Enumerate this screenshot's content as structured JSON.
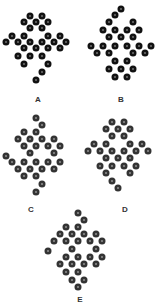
{
  "figure": {
    "panels": [
      {
        "label": "A",
        "label_pos": [
          38,
          96
        ],
        "tone": "dark",
        "dots": [
          [
            30,
            16
          ],
          [
            42,
            16
          ],
          [
            24,
            22
          ],
          [
            36,
            22
          ],
          [
            48,
            22
          ],
          [
            30,
            28
          ],
          [
            42,
            28
          ],
          [
            12,
            36
          ],
          [
            24,
            36
          ],
          [
            48,
            36
          ],
          [
            60,
            36
          ],
          [
            6,
            42
          ],
          [
            18,
            42
          ],
          [
            30,
            42
          ],
          [
            42,
            42
          ],
          [
            54,
            42
          ],
          [
            66,
            42
          ],
          [
            24,
            48
          ],
          [
            36,
            48
          ],
          [
            48,
            48
          ],
          [
            60,
            48
          ],
          [
            18,
            56
          ],
          [
            30,
            56
          ],
          [
            42,
            56
          ],
          [
            24,
            64
          ],
          [
            48,
            64
          ],
          [
            42,
            72
          ],
          [
            36,
            80
          ]
        ]
      },
      {
        "label": "B",
        "label_pos": [
          121,
          96
        ],
        "tone": "dark",
        "dots": [
          [
            121,
            9
          ],
          [
            115,
            15
          ],
          [
            109,
            22
          ],
          [
            133,
            22
          ],
          [
            103,
            30
          ],
          [
            115,
            30
          ],
          [
            127,
            30
          ],
          [
            139,
            30
          ],
          [
            109,
            37
          ],
          [
            121,
            37
          ],
          [
            133,
            37
          ],
          [
            91,
            46
          ],
          [
            103,
            46
          ],
          [
            115,
            46
          ],
          [
            127,
            46
          ],
          [
            139,
            46
          ],
          [
            151,
            46
          ],
          [
            97,
            53
          ],
          [
            109,
            53
          ],
          [
            133,
            53
          ],
          [
            145,
            53
          ],
          [
            115,
            61
          ],
          [
            127,
            61
          ],
          [
            109,
            69
          ],
          [
            121,
            69
          ],
          [
            133,
            69
          ],
          [
            115,
            77
          ],
          [
            127,
            77
          ]
        ]
      },
      {
        "label": "C",
        "label_pos": [
          31,
          206
        ],
        "tone": "gray",
        "dots": [
          [
            36,
            118
          ],
          [
            42,
            125
          ],
          [
            24,
            132
          ],
          [
            36,
            132
          ],
          [
            18,
            139
          ],
          [
            30,
            139
          ],
          [
            42,
            139
          ],
          [
            54,
            139
          ],
          [
            24,
            146
          ],
          [
            36,
            146
          ],
          [
            48,
            146
          ],
          [
            60,
            146
          ],
          [
            30,
            153
          ],
          [
            54,
            153
          ],
          [
            6,
            156
          ],
          [
            12,
            162
          ],
          [
            24,
            162
          ],
          [
            36,
            162
          ],
          [
            48,
            162
          ],
          [
            60,
            162
          ],
          [
            18,
            169
          ],
          [
            30,
            169
          ],
          [
            42,
            169
          ],
          [
            54,
            169
          ],
          [
            24,
            176
          ],
          [
            36,
            176
          ],
          [
            42,
            184
          ],
          [
            36,
            192
          ]
        ]
      },
      {
        "label": "D",
        "label_pos": [
          125,
          206
        ],
        "tone": "gray",
        "dots": [
          [
            112,
            122
          ],
          [
            124,
            122
          ],
          [
            106,
            129
          ],
          [
            118,
            129
          ],
          [
            130,
            129
          ],
          [
            112,
            136
          ],
          [
            124,
            136
          ],
          [
            94,
            144
          ],
          [
            106,
            144
          ],
          [
            130,
            144
          ],
          [
            142,
            144
          ],
          [
            88,
            151
          ],
          [
            100,
            151
          ],
          [
            112,
            151
          ],
          [
            124,
            151
          ],
          [
            136,
            151
          ],
          [
            148,
            151
          ],
          [
            106,
            158
          ],
          [
            118,
            158
          ],
          [
            130,
            158
          ],
          [
            100,
            166
          ],
          [
            112,
            166
          ],
          [
            124,
            166
          ],
          [
            136,
            166
          ],
          [
            106,
            173
          ],
          [
            130,
            173
          ],
          [
            112,
            181
          ],
          [
            118,
            188
          ]
        ]
      },
      {
        "label": "E",
        "label_pos": [
          80,
          300
        ],
        "tone": "gray",
        "dots": [
          [
            78,
            213
          ],
          [
            84,
            220
          ],
          [
            66,
            227
          ],
          [
            78,
            227
          ],
          [
            60,
            234
          ],
          [
            72,
            234
          ],
          [
            84,
            234
          ],
          [
            96,
            234
          ],
          [
            54,
            241
          ],
          [
            66,
            241
          ],
          [
            78,
            241
          ],
          [
            90,
            241
          ],
          [
            102,
            241
          ],
          [
            48,
            251
          ],
          [
            72,
            249
          ],
          [
            96,
            249
          ],
          [
            66,
            257
          ],
          [
            78,
            257
          ],
          [
            90,
            257
          ],
          [
            102,
            257
          ],
          [
            60,
            264
          ],
          [
            72,
            264
          ],
          [
            84,
            264
          ],
          [
            96,
            264
          ],
          [
            66,
            272
          ],
          [
            78,
            272
          ],
          [
            72,
            280
          ],
          [
            84,
            280
          ],
          [
            78,
            287
          ]
        ]
      }
    ]
  }
}
